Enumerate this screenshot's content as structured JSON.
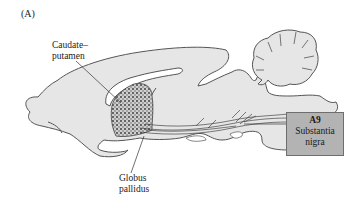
{
  "figure": {
    "panel_label": "(A)",
    "labels": {
      "caudate_putamen_line1": "Caudate–",
      "caudate_putamen_line2": "putamen",
      "globus_pallidus_line1": "Globus",
      "globus_pallidus_line2": "pallidus"
    },
    "nucleus_box": {
      "code": "A9",
      "name_line1": "Substantia",
      "name_line2": "nigra"
    },
    "colors": {
      "brain_fill": "#e6e6e6",
      "brain_outline": "#555555",
      "box_fill": "#b3b3b3",
      "pathway": "#444444"
    }
  }
}
